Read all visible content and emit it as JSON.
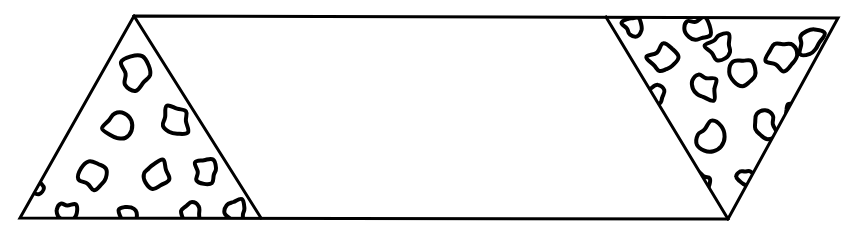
{
  "figure": {
    "background_color": "#ffffff",
    "ink_color": "#000000",
    "stroke_width": 3,
    "caption": "",
    "outline": {
      "name": "parallelogram-band",
      "description": "Slanted quadrilateral band drawn as a single closed outline",
      "points": [
        [
          134,
          16
        ],
        [
          838,
          18
        ],
        [
          728,
          219
        ],
        [
          20,
          218
        ]
      ]
    },
    "regions": [
      {
        "name": "left-triangle",
        "description": "Left end triangle filled with irregular blob texture",
        "points": [
          [
            134,
            16
          ],
          [
            261,
            218
          ],
          [
            20,
            218
          ]
        ],
        "fill": "none",
        "texture": "blobs"
      },
      {
        "name": "right-triangle",
        "description": "Right end inverted triangle filled with irregular blob texture",
        "points": [
          [
            606,
            17
          ],
          [
            838,
            18
          ],
          [
            728,
            219
          ]
        ],
        "fill": "none",
        "texture": "blobs"
      }
    ],
    "blobs": {
      "description": "Hand-drawn irregular ring outlines (pebble / gravel marks)",
      "stroke_width": 4,
      "left": [
        {
          "cx": 136,
          "cy": 72,
          "r": 15,
          "rot": 12,
          "seed": 1
        },
        {
          "cx": 118,
          "cy": 127,
          "r": 15,
          "rot": 55,
          "seed": 2
        },
        {
          "cx": 175,
          "cy": 121,
          "r": 14,
          "rot": 200,
          "seed": 3
        },
        {
          "cx": 94,
          "cy": 176,
          "r": 15,
          "rot": 130,
          "seed": 4
        },
        {
          "cx": 155,
          "cy": 174,
          "r": 13,
          "rot": 20,
          "seed": 5
        },
        {
          "cx": 206,
          "cy": 172,
          "r": 13,
          "rot": 300,
          "seed": 6
        },
        {
          "cx": 66,
          "cy": 213,
          "r": 11,
          "rot": 80,
          "seed": 7
        },
        {
          "cx": 128,
          "cy": 215,
          "r": 9,
          "rot": 170,
          "seed": 8
        },
        {
          "cx": 190,
          "cy": 214,
          "r": 11,
          "rot": 240,
          "seed": 9
        },
        {
          "cx": 236,
          "cy": 212,
          "r": 11,
          "rot": 15,
          "seed": 10
        },
        {
          "cx": 44,
          "cy": 138,
          "r": 9,
          "rot": 95,
          "seed": 11
        },
        {
          "cx": 33,
          "cy": 185,
          "r": 10,
          "rot": 215,
          "seed": 12
        }
      ],
      "right": [
        {
          "cx": 633,
          "cy": 25,
          "r": 10,
          "rot": 30,
          "seed": 13
        },
        {
          "cx": 697,
          "cy": 30,
          "r": 12,
          "rot": 140,
          "seed": 14
        },
        {
          "cx": 810,
          "cy": 42,
          "r": 14,
          "rot": 250,
          "seed": 15
        },
        {
          "cx": 663,
          "cy": 60,
          "r": 14,
          "rot": 70,
          "seed": 16
        },
        {
          "cx": 720,
          "cy": 47,
          "r": 13,
          "rot": 185,
          "seed": 17
        },
        {
          "cx": 781,
          "cy": 55,
          "r": 14,
          "rot": 320,
          "seed": 18
        },
        {
          "cx": 745,
          "cy": 72,
          "r": 14,
          "rot": 100,
          "seed": 19
        },
        {
          "cx": 703,
          "cy": 87,
          "r": 14,
          "rot": 210,
          "seed": 20
        },
        {
          "cx": 655,
          "cy": 97,
          "r": 10,
          "rot": 45,
          "seed": 21
        },
        {
          "cx": 764,
          "cy": 125,
          "r": 14,
          "rot": 155,
          "seed": 22
        },
        {
          "cx": 710,
          "cy": 138,
          "r": 14,
          "rot": 275,
          "seed": 23
        },
        {
          "cx": 795,
          "cy": 110,
          "r": 9,
          "rot": 60,
          "seed": 24
        },
        {
          "cx": 745,
          "cy": 178,
          "r": 9,
          "rot": 190,
          "seed": 25
        },
        {
          "cx": 702,
          "cy": 183,
          "r": 10,
          "rot": 330,
          "seed": 26
        },
        {
          "cx": 772,
          "cy": 160,
          "r": 8,
          "rot": 115,
          "seed": 27
        }
      ]
    }
  }
}
